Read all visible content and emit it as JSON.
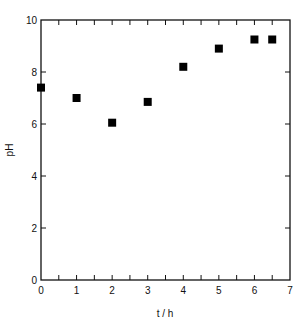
{
  "chart_data": {
    "type": "scatter",
    "title": "",
    "xlabel": "t / h",
    "ylabel": "pH",
    "xlim": [
      0,
      7
    ],
    "ylim": [
      0,
      10
    ],
    "grid": false,
    "legend": null,
    "x_major_ticks": [
      0,
      1,
      2,
      3,
      4,
      5,
      6,
      7
    ],
    "x_minor_ticks": [
      0.5,
      1.5,
      2.5,
      3.5,
      4.5,
      5.5,
      6.5
    ],
    "y_major_ticks": [
      0,
      2,
      4,
      6,
      8,
      10
    ],
    "marker": "filled-square",
    "marker_color": "#000000",
    "series": [
      {
        "name": "pH",
        "x": [
          0,
          1,
          2,
          3,
          4,
          5,
          6,
          6.5
        ],
        "y": [
          7.4,
          7.0,
          6.05,
          6.85,
          8.2,
          8.9,
          9.25,
          9.25
        ]
      }
    ]
  },
  "axes": {
    "x_tick_labels": [
      "0",
      "1",
      "2",
      "3",
      "4",
      "5",
      "6",
      "7"
    ],
    "y_tick_labels": [
      "0",
      "2",
      "4",
      "6",
      "8",
      "10"
    ]
  }
}
